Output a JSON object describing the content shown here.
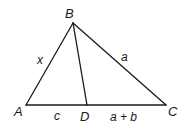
{
  "diagram": {
    "type": "triangle",
    "stroke_color": "#1a1a1a",
    "vertices": {
      "A": {
        "label": "A",
        "x": 26,
        "y": 105
      },
      "B": {
        "label": "B",
        "x": 73,
        "y": 23
      },
      "C": {
        "label": "C",
        "x": 166,
        "y": 105
      },
      "D": {
        "label": "D",
        "x": 87,
        "y": 105
      }
    },
    "segments": [
      {
        "from": "A",
        "to": "B",
        "label": "x"
      },
      {
        "from": "B",
        "to": "C",
        "label": "a"
      },
      {
        "from": "B",
        "to": "D",
        "label": ""
      },
      {
        "from": "A",
        "to": "D",
        "label": "c"
      },
      {
        "from": "D",
        "to": "C",
        "label": "a + b"
      }
    ],
    "labels": {
      "A": "A",
      "B": "B",
      "C": "C",
      "D": "D",
      "AB": "x",
      "BC": "a",
      "AD": "c",
      "DC": "a + b"
    }
  }
}
